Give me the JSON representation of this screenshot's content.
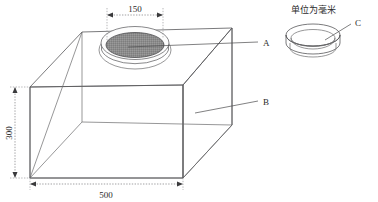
{
  "figure": {
    "kind": "isometric-technical-drawing",
    "note_text": "单位为毫米",
    "background_color": "#ffffff",
    "line_color": "#58585a",
    "disc_fill_color": "#8c8c8c",
    "text_color": "#2b2b2b"
  },
  "dimensions": [
    {
      "id": "width-top-opening",
      "value": "150",
      "orientation": "horizontal"
    },
    {
      "id": "box-height",
      "value": "300",
      "orientation": "vertical"
    },
    {
      "id": "box-width",
      "value": "500",
      "orientation": "horizontal"
    }
  ],
  "callouts": [
    {
      "id": "callout-a",
      "label": "A",
      "target": "circular-pad-on-box-top"
    },
    {
      "id": "callout-b",
      "label": "B",
      "target": "box-body"
    },
    {
      "id": "callout-c",
      "label": "C",
      "target": "shallow-dish"
    }
  ],
  "labels": {
    "a": "A",
    "b": "B",
    "c": "C",
    "dim_150": "150",
    "dim_300": "300",
    "dim_500": "500",
    "units_note": "单位为毫米"
  }
}
